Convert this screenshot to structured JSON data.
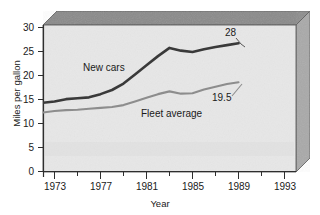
{
  "chart_data": {
    "type": "line",
    "title": "",
    "xlabel": "Year",
    "ylabel": "Miles per gallon",
    "xlim": [
      1973,
      1995
    ],
    "ylim": [
      0,
      32
    ],
    "xticks": [
      1973,
      1977,
      1981,
      1985,
      1989,
      1993
    ],
    "xtick_labels": [
      "1973",
      "1977",
      "1981",
      "1985",
      "1989",
      "1993"
    ],
    "yticks": [
      0,
      5,
      10,
      15,
      20,
      25,
      30
    ],
    "ytick_labels": [
      "0",
      "5",
      "10",
      "15",
      "20",
      "25",
      "30"
    ],
    "minor_xticks": [
      1975,
      1979,
      1983,
      1987,
      1991
    ],
    "grid": false,
    "legend_position": "inline-annotations",
    "series": [
      {
        "name": "New cars",
        "color": "#3a3a3a",
        "label_text": "New cars",
        "end_value_label": "28",
        "x": [
          1973,
          1974,
          1975,
          1976,
          1977,
          1978,
          1979,
          1980,
          1981,
          1982,
          1983,
          1984,
          1985,
          1986,
          1987,
          1988,
          1989,
          1990
        ],
        "values": [
          15.0,
          15.3,
          15.8,
          16.0,
          16.2,
          16.9,
          17.8,
          19.2,
          21.2,
          23.2,
          25.2,
          27.0,
          26.4,
          26.1,
          26.7,
          27.2,
          27.6,
          28.0
        ]
      },
      {
        "name": "Fleet average",
        "color": "#8d8d8d",
        "label_text": "Fleet average",
        "end_value_label": "19.5",
        "x": [
          1973,
          1974,
          1975,
          1976,
          1977,
          1978,
          1979,
          1980,
          1981,
          1982,
          1983,
          1984,
          1985,
          1986,
          1987,
          1988,
          1989,
          1990
        ],
        "values": [
          12.9,
          13.2,
          13.4,
          13.5,
          13.7,
          13.9,
          14.1,
          14.5,
          15.3,
          16.1,
          16.9,
          17.5,
          17.0,
          17.1,
          17.9,
          18.5,
          19.1,
          19.5
        ]
      }
    ]
  },
  "frame": {
    "top_face_color": "#8a8a8a",
    "right_face_color": "#a8a8a8",
    "plot_bg_color": "#e6e6e6",
    "outline_color": "#4a4a4a"
  }
}
